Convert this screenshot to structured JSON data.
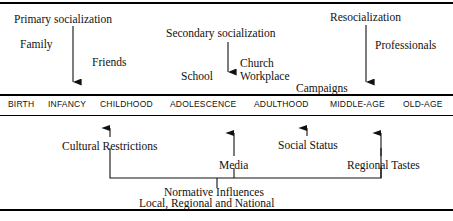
{
  "diagram": {
    "stage_band": {
      "stages": [
        {
          "label": "BIRTH",
          "x": 8
        },
        {
          "label": "INFANCY",
          "x": 48
        },
        {
          "label": "CHILDHOOD",
          "x": 100
        },
        {
          "label": "ADOLESCENCE",
          "x": 170
        },
        {
          "label": "ADULTHOOD",
          "x": 254
        },
        {
          "label": "MIDDLE-AGE",
          "x": 330
        },
        {
          "label": "OLD-AGE",
          "x": 403
        }
      ]
    },
    "top_section": {
      "headings": [
        {
          "id": "primary",
          "label": "Primary socialization",
          "x": 14,
          "y": 14
        },
        {
          "id": "secondary",
          "label": "Secondary socialization",
          "x": 166,
          "y": 28
        },
        {
          "id": "reso",
          "label": "Resocialization",
          "x": 330,
          "y": 12
        }
      ],
      "agents": [
        {
          "id": "family",
          "label": "Family",
          "x": 20,
          "y": 39
        },
        {
          "id": "friends",
          "label": "Friends",
          "x": 92,
          "y": 57
        },
        {
          "id": "school",
          "label": "School",
          "x": 181,
          "y": 71
        },
        {
          "id": "church",
          "label": "Church",
          "x": 240,
          "y": 58
        },
        {
          "id": "workplace",
          "label": "Workplace",
          "x": 240,
          "y": 71
        },
        {
          "id": "campaigns",
          "label": "Campaigns",
          "x": 296,
          "y": 83
        },
        {
          "id": "professionals",
          "label": "Professionals",
          "x": 375,
          "y": 40
        }
      ],
      "arrows": [
        {
          "id": "primary-arrow",
          "x": 73,
          "y1": 26,
          "y2": 90
        },
        {
          "id": "secondary-arrow",
          "x": 228,
          "y1": 42,
          "y2": 80
        },
        {
          "id": "reso-arrow",
          "x": 366,
          "y1": 25,
          "y2": 90
        }
      ]
    },
    "bottom_section": {
      "influences": [
        {
          "id": "cultural-restrictions",
          "label": "Cultural Restrictions",
          "x": 62,
          "y": 141
        },
        {
          "id": "media",
          "label": "Media",
          "x": 219,
          "y": 160
        },
        {
          "id": "social-status",
          "label": "Social Status",
          "x": 278,
          "y": 140
        },
        {
          "id": "regional-tastes",
          "label": "Regional Tastes",
          "x": 347,
          "y": 160
        }
      ],
      "arrows": [
        {
          "id": "cultural-arrow",
          "x": 110,
          "y1": 137,
          "y2": 120
        },
        {
          "id": "media-arrow",
          "x": 234,
          "y1": 155,
          "y2": 125
        },
        {
          "id": "status-arrow",
          "x": 307,
          "y1": 136,
          "y2": 120
        },
        {
          "id": "regional-arrow",
          "x": 381,
          "y1": 155,
          "y2": 125
        }
      ],
      "bracket": {
        "left_x": 110,
        "right_x": 381,
        "baseline_y": 178,
        "leg_top_y": 148,
        "stub_x": 217,
        "stub_bottom_y": 188
      },
      "summary_lines": [
        {
          "id": "normative-influences",
          "label": "Normative Influences",
          "x": 164,
          "y": 187
        },
        {
          "id": "local-regional",
          "label": "Local, Regional and National",
          "x": 139,
          "y": 198
        }
      ]
    }
  }
}
